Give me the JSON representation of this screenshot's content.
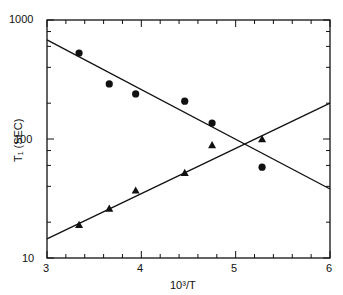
{
  "chart_data": {
    "type": "scatter",
    "title": "",
    "xlabel": "10³/T",
    "ylabel": "T₁ (SEC)",
    "xlim": [
      3,
      6
    ],
    "ylim": [
      10,
      1000
    ],
    "yscale": "log",
    "grid": false,
    "legend": null,
    "x_ticks": [
      "3",
      "4",
      "5",
      "6"
    ],
    "y_ticks": [
      "10",
      "100",
      "1000"
    ],
    "series": [
      {
        "name": "circles",
        "marker": "circle",
        "x": [
          3.34,
          3.66,
          3.94,
          4.46,
          4.75,
          5.28
        ],
        "y": [
          528,
          290,
          239,
          208,
          136,
          58
        ]
      },
      {
        "name": "triangles",
        "marker": "triangle",
        "x": [
          3.34,
          3.66,
          3.94,
          4.46,
          4.75,
          5.28
        ],
        "y": [
          19,
          26,
          37,
          52,
          89,
          100
        ]
      }
    ],
    "fit_lines": [
      {
        "name": "circles-fit",
        "x": [
          3,
          6
        ],
        "y": [
          680,
          38
        ]
      },
      {
        "name": "triangles-fit",
        "x": [
          3,
          6
        ],
        "y": [
          14.5,
          200
        ]
      }
    ]
  },
  "labels": {
    "xlabel": "10³/T",
    "ylabel": "T₁ (SEC)",
    "x3": "3",
    "x4": "4",
    "x5": "5",
    "x6": "6",
    "y10": "10",
    "y100": "100",
    "y1000": "1000"
  }
}
